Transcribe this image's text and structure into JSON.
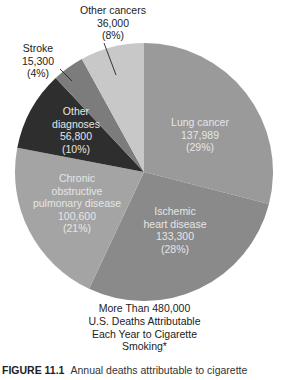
{
  "chart_data": {
    "type": "pie",
    "title": "More Than 480,000 U.S. Deaths Attributable Each Year to Cigarette Smoking*",
    "total_label": "More Than 480,000",
    "slices": [
      {
        "name": "Lung cancer",
        "value": 137989,
        "value_label": "137,989",
        "percent": 29,
        "percent_label": "(29%)",
        "color": "#9a9a9a"
      },
      {
        "name": "Ischemic heart disease",
        "value": 133300,
        "value_label": "133,300",
        "percent": 28,
        "percent_label": "(28%)",
        "color": "#8a8a8a"
      },
      {
        "name": "Chronic obstructive pulmonary disease",
        "value": 100600,
        "value_label": "100,600",
        "percent": 21,
        "percent_label": "(21%)",
        "color": "#a4a4a4"
      },
      {
        "name": "Other diagnoses",
        "value": 56800,
        "value_label": "56,800",
        "percent": 10,
        "percent_label": "(10%)",
        "color": "#2e2e2e"
      },
      {
        "name": "Stroke",
        "value": 15300,
        "value_label": "15,300",
        "percent": 4,
        "percent_label": "(4%)",
        "color": "#7c7c7c"
      },
      {
        "name": "Other cancers",
        "value": 36000,
        "value_label": "36,000",
        "percent": 8,
        "percent_label": "(8%)",
        "color": "#c8c8c8"
      }
    ],
    "start_angle_deg": 0,
    "direction": "clockwise",
    "legend": "none (direct labels)"
  },
  "labels": {
    "lung": {
      "l1": "Lung cancer",
      "l2": "137,989",
      "l3": "(29%)"
    },
    "ischemic": {
      "l1": "Ischemic",
      "l2": "heart disease",
      "l3": "133,300",
      "l4": "(28%)"
    },
    "copd": {
      "l1": "Chronic",
      "l2": "obstructive",
      "l3": "pulmonary disease",
      "l4": "100,600",
      "l5": "(21%)"
    },
    "other_diag": {
      "l1": "Other",
      "l2": "diagnoses",
      "l3": "56,800",
      "l4": "(10%)"
    },
    "stroke": {
      "l1": "Stroke",
      "l2": "15,300",
      "l3": "(4%)"
    },
    "other_cancers": {
      "l1": "Other cancers",
      "l2": "36,000",
      "l3": "(8%)"
    }
  },
  "summary": {
    "l1": "More Than 480,000",
    "l2": "U.S. Deaths Attributable",
    "l3": "Each Year to Cigarette",
    "l4": "Smoking*"
  },
  "caption": {
    "figure": "FIGURE 11.1",
    "text": "Annual deaths attributable to cigarette"
  }
}
